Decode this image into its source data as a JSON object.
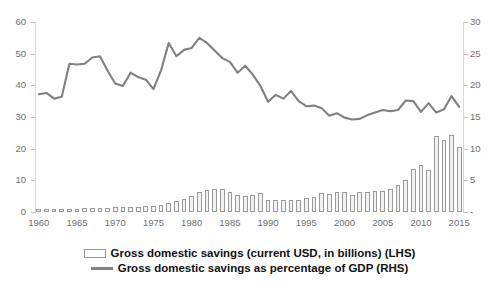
{
  "chart_data": {
    "type": "bar",
    "title": "",
    "subtitle": "",
    "xlabel": "",
    "ylabel": "",
    "grid": false,
    "legend_position": "bottom",
    "x": [
      1960,
      1961,
      1962,
      1963,
      1964,
      1965,
      1966,
      1967,
      1968,
      1969,
      1970,
      1971,
      1972,
      1973,
      1974,
      1975,
      1976,
      1977,
      1978,
      1979,
      1980,
      1981,
      1982,
      1983,
      1984,
      1985,
      1986,
      1987,
      1988,
      1989,
      1990,
      1991,
      1992,
      1993,
      1994,
      1995,
      1996,
      1997,
      1998,
      1999,
      2000,
      2001,
      2002,
      2003,
      2004,
      2005,
      2006,
      2007,
      2008,
      2009,
      2010,
      2011,
      2012,
      2013,
      2014,
      2015
    ],
    "xticks": [
      1960,
      1965,
      1970,
      1975,
      1980,
      1985,
      1990,
      1995,
      2000,
      2005,
      2010,
      2015
    ],
    "axes": {
      "left": {
        "label": "Gross domestic savings (current USD, in billions)",
        "ticks": [
          0,
          10,
          20,
          30,
          40,
          50,
          60
        ],
        "ylim": [
          0,
          60
        ]
      },
      "right": {
        "label": "Gross domestic savings as percentage of GDP",
        "ticks": [
          0,
          5,
          10,
          15,
          20,
          25,
          30
        ],
        "ticklabels": [
          "-",
          "5",
          "10",
          "15",
          "20",
          "25",
          "30"
        ],
        "ylim": [
          0,
          30
        ]
      }
    },
    "series": [
      {
        "name": "Gross domestic savings (current USD, in billions) (LHS)",
        "type": "bar",
        "axis": "left",
        "color": "#f2f2f2",
        "edgecolor": "#9a9a9a",
        "values": [
          0.9,
          0.9,
          0.8,
          1.0,
          1.1,
          1.1,
          1.2,
          1.3,
          1.3,
          1.4,
          1.5,
          1.5,
          1.6,
          1.7,
          1.8,
          1.9,
          2.1,
          2.7,
          3.4,
          4.2,
          5.0,
          6.2,
          7.0,
          7.3,
          7.2,
          6.4,
          5.3,
          5.2,
          5.5,
          6.0,
          3.8,
          3.7,
          3.7,
          3.7,
          3.9,
          4.4,
          4.7,
          6.1,
          5.6,
          6.4,
          6.2,
          5.3,
          6.4,
          6.4,
          6.6,
          6.6,
          7.4,
          8.4,
          10.0,
          13.7,
          14.8,
          13.4,
          24.1,
          22.7,
          24.2,
          20.6
        ]
      },
      {
        "name": "Gross domestic savings as percentage of GDP (RHS)",
        "type": "line",
        "axis": "right",
        "color": "#808080",
        "values": [
          18.6,
          18.8,
          17.9,
          18.2,
          23.4,
          23.3,
          23.4,
          24.4,
          24.6,
          22.3,
          20.3,
          19.9,
          22.0,
          21.3,
          20.9,
          19.4,
          22.4,
          26.7,
          24.6,
          25.6,
          25.9,
          27.5,
          26.7,
          25.5,
          24.3,
          23.7,
          22.0,
          23.1,
          21.7,
          19.9,
          17.4,
          18.5,
          17.9,
          19.1,
          17.5,
          16.7,
          16.8,
          16.4,
          15.2,
          15.6,
          14.9,
          14.6,
          14.7,
          15.3,
          15.7,
          16.1,
          15.9,
          16.1,
          17.6,
          17.5,
          15.8,
          17.2,
          15.7,
          16.2,
          18.3,
          16.6
        ]
      }
    ]
  },
  "legend": {
    "items": [
      {
        "marker": "bar-swatch",
        "label": "Gross domestic savings (current USD, in billions) (LHS)"
      },
      {
        "marker": "line-swatch",
        "label": "Gross domestic savings as percentage of GDP (RHS)"
      }
    ]
  },
  "colors": {
    "bar_fill": "#f2f2f2",
    "bar_edge": "#9a9a9a",
    "line": "#808080",
    "axis": "#d9d9d9",
    "tick_text": "#6f6f6f",
    "legend_text": "#111111",
    "background": "#ffffff"
  }
}
